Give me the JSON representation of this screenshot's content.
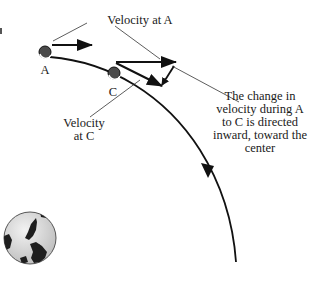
{
  "diagram": {
    "labels": {
      "velocity_at_a": "Velocity at A",
      "point_a": "A",
      "point_c": "C",
      "velocity_at_c_line1": "Velocity",
      "velocity_at_c_line2": "at C",
      "change_line1": "The change in",
      "change_line2": "velocity during A",
      "change_line3": "to C is directed",
      "change_line4": "inward, toward the",
      "change_line5": "center"
    },
    "icons": {
      "earth": "earth-globe-icon",
      "satellite_a": "satellite-ball-icon",
      "satellite_c": "satellite-ball-icon"
    },
    "colors": {
      "stroke": "#111111",
      "pointer_line": "#333333",
      "ball_dark": "#4a4a4a",
      "globe_fill": "#d9d9d9",
      "land": "#1e1e1e"
    }
  }
}
